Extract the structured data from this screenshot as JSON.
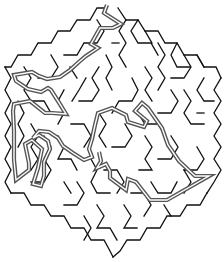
{
  "puzzle": {
    "type": "hexagonal maze",
    "state": "solved",
    "colors": {
      "background": "#ffffff",
      "walls": "#111111",
      "solution_path": "#555555"
    },
    "entrance": "top",
    "exit": "interior-center-right"
  }
}
